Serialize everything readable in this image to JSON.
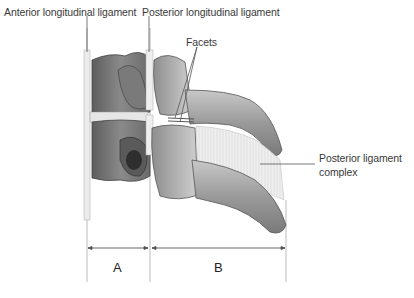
{
  "diagram": {
    "type": "anatomical-illustration",
    "labels": {
      "anterior_longitudinal_ligament": "Anterior longitudinal ligament",
      "posterior_longitudinal_ligament": "Posterior longitudinal ligament",
      "facets": "Facets",
      "posterior_ligament_complex_line1": "Posterior ligament",
      "posterior_ligament_complex_line2": "complex"
    },
    "columns": {
      "a": "A",
      "b": "B"
    },
    "colors": {
      "bone_dark": "#6e6e6e",
      "bone_mid": "#a8a8a8",
      "bone_light": "#d9d9d9",
      "ligament": "#efefef",
      "line": "#888888"
    }
  }
}
